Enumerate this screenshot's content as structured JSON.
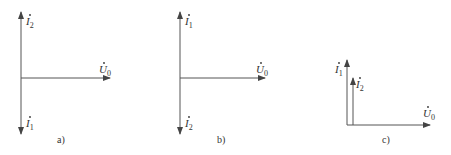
{
  "diagrams": [
    {
      "caption": "a)",
      "vectors": [
        {
          "name": "I",
          "subscript": "2",
          "direction": "up"
        },
        {
          "name": "U",
          "subscript": "0",
          "direction": "right"
        },
        {
          "name": "I",
          "subscript": "1",
          "direction": "down"
        }
      ]
    },
    {
      "caption": "b)",
      "vectors": [
        {
          "name": "I",
          "subscript": "1",
          "direction": "up"
        },
        {
          "name": "U",
          "subscript": "0",
          "direction": "right"
        },
        {
          "name": "I",
          "subscript": "2",
          "direction": "down"
        }
      ]
    },
    {
      "caption": "c)",
      "vectors": [
        {
          "name": "I",
          "subscript": "1",
          "direction": "up"
        },
        {
          "name": "I",
          "subscript": "2",
          "direction": "up"
        },
        {
          "name": "U",
          "subscript": "0",
          "direction": "right"
        }
      ]
    }
  ],
  "colors": {
    "stroke": "#555555",
    "text": "#333333",
    "background": "#ffffff"
  }
}
